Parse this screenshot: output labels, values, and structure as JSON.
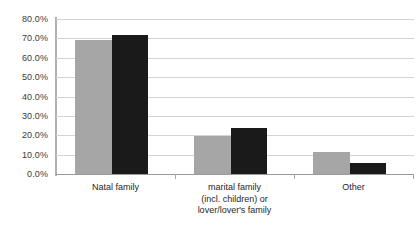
{
  "chart_data": {
    "type": "bar",
    "title": "",
    "subtitle": "",
    "xlabel": "",
    "ylabel": "",
    "ylim": [
      0,
      80
    ],
    "ytick_step": 10,
    "grid": true,
    "legend": "none",
    "categories": [
      "Natal family",
      "marital family (incl. children) or lover/lover's family",
      "Other"
    ],
    "category_lines": [
      [
        "Natal family"
      ],
      [
        "marital family",
        "(incl. children) or",
        "lover/lover's family"
      ],
      [
        "Other"
      ]
    ],
    "ytick_labels": [
      "80.0%",
      "70.0%",
      "60.0%",
      "50.0%",
      "40.0%",
      "30.0%",
      "20.0%",
      "10.0%",
      "0.0%"
    ],
    "ytick_values": [
      80,
      70,
      60,
      50,
      40,
      30,
      20,
      10,
      0
    ],
    "series": [
      {
        "name": "series-1",
        "color": "#a6a6a6",
        "values": [
          69.1,
          19.6,
          11.3
        ]
      },
      {
        "name": "series-2",
        "color": "#1a1a1a",
        "values": [
          71.6,
          23.7,
          5.7
        ]
      }
    ],
    "colors": {
      "series_1": "#a6a6a6",
      "series_2": "#1a1a1a",
      "gridline": "#d4d4d4",
      "axis": "#a8a8a8",
      "text": "#262626",
      "background": "#ffffff"
    }
  }
}
